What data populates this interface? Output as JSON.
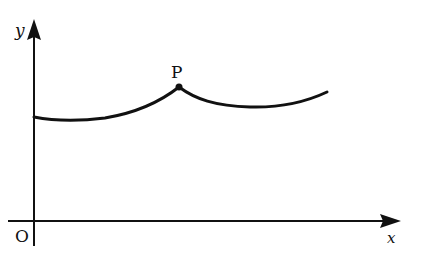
{
  "diagram": {
    "type": "function-graph",
    "axes": {
      "x_label": "x",
      "y_label": "y",
      "origin_label": "O"
    },
    "point": {
      "label": "P",
      "description": "cusp / corner point where curve reaches local maximum"
    },
    "curve": {
      "description": "curve starting on y-axis, dips slightly, rises to corner point P, dips again, then rises",
      "color": "#111111"
    },
    "colors": {
      "ink": "#111111",
      "background": "#ffffff"
    }
  }
}
